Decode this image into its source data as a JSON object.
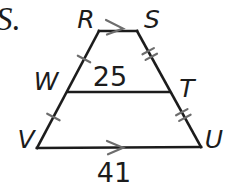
{
  "page": {
    "background_color": "#ffffff",
    "ink_color": "#1c1c1c",
    "mark_color": "#6d6d6d"
  },
  "leading_text": "S.",
  "diagram": {
    "type": "trapezoid-with-midsegment",
    "vertices": {
      "top_left": "R",
      "top_right": "S",
      "mid_left": "W",
      "mid_right": "T",
      "bottom_left": "V",
      "bottom_right": "U"
    },
    "measurements": {
      "midsegment_WT": "25",
      "base_VU": "41"
    },
    "congruence_marks": {
      "segment_RW": "single-tick",
      "segment_WV": "single-tick",
      "segment_ST": "double-tick",
      "segment_TU": "double-tick"
    },
    "parallel_marks": {
      "segment_RS": "single-arrow",
      "segment_VU": "single-arrow"
    }
  }
}
